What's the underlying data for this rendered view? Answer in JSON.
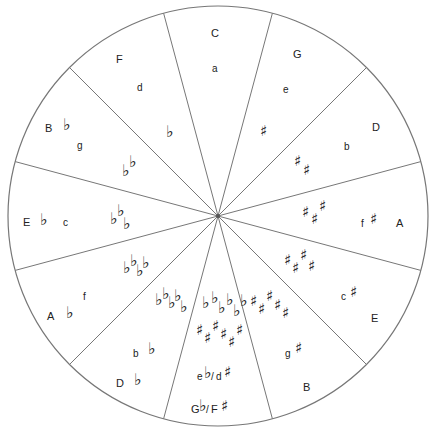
{
  "diagram": {
    "center": [
      218,
      216
    ],
    "radius": 210,
    "line_color": "#777777",
    "segments": [
      {
        "major": "C",
        "minor": "a",
        "accidental": "none",
        "count": 0
      },
      {
        "major": "G",
        "minor": "e",
        "accidental": "sharp",
        "count": 1
      },
      {
        "major": "D",
        "minor": "b",
        "accidental": "sharp",
        "count": 2
      },
      {
        "major": "A",
        "minor": "f",
        "minor_accidental": "♯",
        "accidental": "sharp",
        "count": 3
      },
      {
        "major": "E",
        "minor": "c",
        "minor_accidental": "♯",
        "accidental": "sharp",
        "count": 4
      },
      {
        "major": "B",
        "minor": "g",
        "minor_accidental": "♯",
        "accidental": "sharp",
        "count": 5
      },
      {
        "major": "G♭/F♯",
        "minor": "e♭/d♯",
        "accidental": "both",
        "count": 6
      },
      {
        "major": "D♭",
        "minor": "b♭",
        "accidental": "flat",
        "count": 5
      },
      {
        "major": "A♭",
        "minor": "f",
        "accidental": "flat",
        "count": 4
      },
      {
        "major": "E♭",
        "minor": "c",
        "accidental": "flat",
        "count": 3
      },
      {
        "major": "B♭",
        "minor": "g",
        "accidental": "flat",
        "count": 2
      },
      {
        "major": "F",
        "minor": "d",
        "accidental": "flat",
        "count": 1
      }
    ]
  },
  "labels": {
    "C": "C",
    "a": "a",
    "G": "G",
    "e": "e",
    "D": "D",
    "b": "b",
    "A": "A",
    "f": "f",
    "E": "E",
    "c": "c",
    "B": "B",
    "g": "g",
    "Gb": "G",
    "Fs": "F",
    "eb": "e",
    "ds": "d",
    "Db": "D",
    "bb": "b",
    "Ab": "A",
    "fmin": "f",
    "Eb": "E",
    "cmin": "c",
    "Bb": "B",
    "gmin": "g",
    "F": "F",
    "d": "d",
    "flat": "♭",
    "sharp": "♯",
    "slash": "/"
  }
}
